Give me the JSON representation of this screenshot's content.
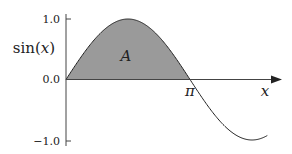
{
  "chart_data": {
    "type": "area",
    "title": "",
    "xlabel": "x",
    "ylabel": "sin(x)",
    "function": "sin(x)",
    "x_range": [
      0,
      5.1
    ],
    "ylim": [
      -1.0,
      1.0
    ],
    "yticks": [
      {
        "value": 1.0,
        "label": "1.0"
      },
      {
        "value": 0.0,
        "label": "0.0"
      },
      {
        "value": -1.0,
        "label": "-1.0"
      }
    ],
    "xticks": [
      {
        "value": 3.14159,
        "label": "π"
      }
    ],
    "shaded_region": {
      "label": "A",
      "from": 0,
      "to": 3.14159,
      "description": "area under sin(x) from 0 to π"
    },
    "x": [
      0,
      0.5,
      1.0,
      1.5708,
      2.0,
      2.5,
      3.14159,
      3.5,
      4.0,
      4.7124,
      5.1
    ],
    "values": [
      0,
      0.479,
      0.841,
      1.0,
      0.909,
      0.598,
      0,
      -0.351,
      -0.757,
      -1.0,
      -0.926
    ],
    "grid": false,
    "legend": null
  },
  "labels": {
    "ylabel": "sin(x)",
    "xlabel": "x",
    "area": "A",
    "pi": "π",
    "y1": "1.0",
    "y0": "0.0",
    "ym1": "−1.0"
  },
  "colors": {
    "fill": "#9a9a9a",
    "curve": "#222222",
    "axis": "#444444"
  }
}
